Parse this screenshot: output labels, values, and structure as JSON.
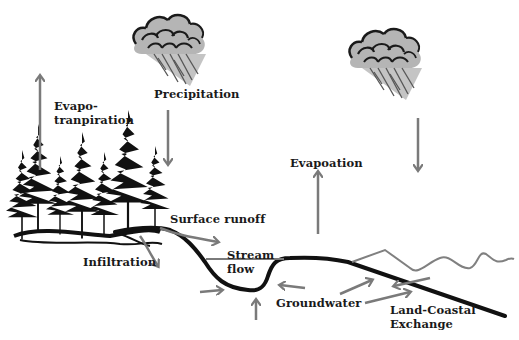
{
  "diagram": {
    "labels": {
      "evapotranspiration_line1": "Evapo-",
      "evapotranspiration_line2": "tranpiration",
      "precipitation": "Precipitation",
      "evaporation": "Evapoation",
      "surface_runoff": "Surface runoff",
      "infiltration": "Infiltration",
      "stream_line1": "Stream",
      "stream_line2": "flow",
      "groundwater": "Groundwater",
      "land_coastal_line1": "Land-Coastal",
      "land_coastal_line2": "Exchange"
    },
    "colors": {
      "arrow": "#7a7a7a",
      "terrain": "#111111",
      "cloud_fill": "#b5b5b5",
      "cloud_outline": "#1a1a1a",
      "sea_wave": "#808080",
      "tree": "#111111"
    }
  }
}
